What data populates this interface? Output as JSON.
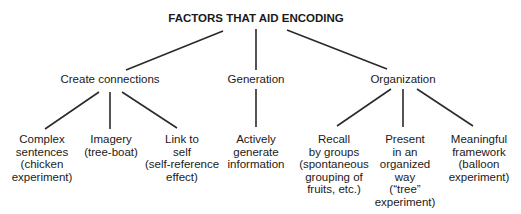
{
  "title": "FACTORS THAT AID ENCODING",
  "categories": [
    {
      "label": "Create connections",
      "children": [
        {
          "lines": [
            "Complex",
            "sentences",
            "(chicken",
            "experiment)"
          ]
        },
        {
          "lines": [
            "Imagery",
            "(tree-boat)"
          ]
        },
        {
          "lines": [
            "Link to",
            "self",
            "(self-reference",
            "effect)"
          ]
        }
      ]
    },
    {
      "label": "Generation",
      "children": [
        {
          "lines": [
            "Actively",
            "generate",
            "information"
          ]
        }
      ]
    },
    {
      "label": "Organization",
      "children": [
        {
          "lines": [
            "Recall",
            "by groups",
            "(spontaneous",
            "grouping of",
            "fruits, etc.)"
          ]
        },
        {
          "lines": [
            "Present",
            "in an",
            "organized",
            "way",
            "(“tree”",
            "experiment)"
          ]
        },
        {
          "lines": [
            "Meaningful",
            "framework",
            "(balloon",
            "experiment)"
          ]
        }
      ]
    }
  ],
  "colors": {
    "line": "#2a2a2a",
    "text": "#1a1a1a"
  }
}
